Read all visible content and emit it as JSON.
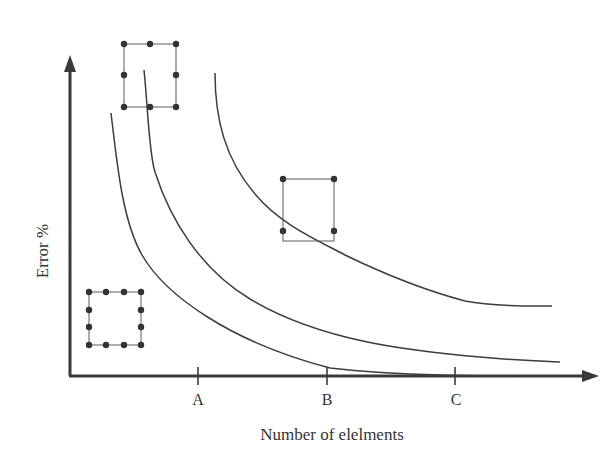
{
  "diagram": {
    "title": "",
    "y_axis": {
      "label": "Error %"
    },
    "x_axis": {
      "label": "Number of elelments",
      "ticks": [
        {
          "label": "A",
          "x": 198
        },
        {
          "label": "B",
          "x": 327
        },
        {
          "label": "C",
          "x": 455
        }
      ]
    },
    "curves": [
      {
        "name": "curve-12-node-element",
        "description": "lowest error curve (12-node element)",
        "color": "#3d3d3d"
      },
      {
        "name": "curve-8-node-element",
        "description": "middle error curve (8-node element)",
        "color": "#3d3d3d"
      },
      {
        "name": "curve-4-node-element",
        "description": "highest error curve (4-node element)",
        "color": "#3d3d3d"
      }
    ],
    "element_icons": [
      {
        "name": "4-node-element-icon",
        "nodes": 4,
        "nodes_per_side": 2
      },
      {
        "name": "8-node-element-icon",
        "nodes": 8,
        "nodes_per_side": 3
      },
      {
        "name": "12-node-element-icon",
        "nodes": 12,
        "nodes_per_side": 4
      }
    ],
    "colors": {
      "axis": "#3a3a3a",
      "curve": "#3d3d3d",
      "node": "#333333",
      "background": "#ffffff"
    }
  }
}
